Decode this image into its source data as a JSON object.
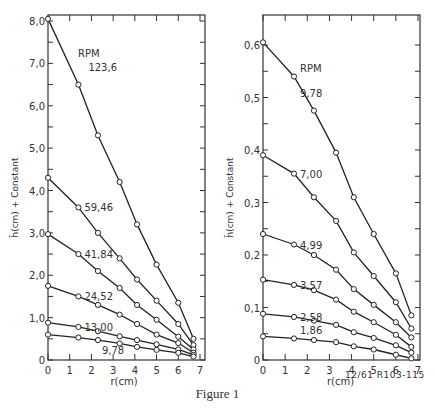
{
  "figure": {
    "caption": "Figure 1",
    "code": "12/61 R103-115"
  },
  "chart_data": [
    {
      "type": "line",
      "title": "",
      "legend_title": "RPM",
      "xlabel": "r(cm)",
      "ylabel": "h̄(cm) + Constant",
      "xlim": [
        0,
        7
      ],
      "ylim": [
        0,
        8.0
      ],
      "xticks": [
        "0",
        "1",
        "2",
        "3",
        "4",
        "5",
        "6",
        "7"
      ],
      "yticks": [
        "0",
        "1.0",
        "2.0",
        "3.0",
        "4.0",
        "5.0",
        "6.0",
        "7.0",
        "8.0"
      ],
      "x": [
        0,
        1.4,
        2.3,
        3.3,
        4.1,
        5.0,
        6.0,
        6.7
      ],
      "series": [
        {
          "name": "123.6",
          "values": [
            8.05,
            6.5,
            5.3,
            4.2,
            3.2,
            2.25,
            1.35,
            0.5
          ]
        },
        {
          "name": "59.46",
          "values": [
            4.3,
            3.6,
            3.0,
            2.4,
            1.9,
            1.4,
            0.85,
            0.35
          ]
        },
        {
          "name": "41.84",
          "values": [
            2.97,
            2.5,
            2.1,
            1.7,
            1.3,
            0.95,
            0.55,
            0.25
          ]
        },
        {
          "name": "24.52",
          "values": [
            1.75,
            1.5,
            1.3,
            1.07,
            0.85,
            0.6,
            0.4,
            0.17
          ]
        },
        {
          "name": "13.00",
          "values": [
            0.88,
            0.78,
            0.68,
            0.56,
            0.47,
            0.37,
            0.25,
            0.12
          ]
        },
        {
          "name": "9.78",
          "values": [
            0.6,
            0.53,
            0.47,
            0.39,
            0.31,
            0.24,
            0.17,
            0.08
          ]
        }
      ]
    },
    {
      "type": "line",
      "title": "",
      "legend_title": "RPM",
      "xlabel": "r(cm)",
      "ylabel": "h̄(cm) + Constant",
      "xlim": [
        0,
        7
      ],
      "ylim": [
        0,
        0.6
      ],
      "xticks": [
        "0",
        "1",
        "2",
        "3",
        "4",
        "5",
        "6",
        "7"
      ],
      "yticks": [
        "0",
        "0.1",
        "0.2",
        "0.3",
        "0.4",
        "0.5",
        "0.6"
      ],
      "x": [
        0,
        1.4,
        2.3,
        3.3,
        4.1,
        5.0,
        6.0,
        6.7
      ],
      "series": [
        {
          "name": "9.78",
          "values": [
            0.605,
            0.54,
            0.475,
            0.395,
            0.31,
            0.24,
            0.165,
            0.085
          ]
        },
        {
          "name": "7.00",
          "values": [
            0.39,
            0.355,
            0.31,
            0.265,
            0.205,
            0.16,
            0.11,
            0.06
          ]
        },
        {
          "name": "4.99",
          "values": [
            0.24,
            0.22,
            0.2,
            0.172,
            0.135,
            0.105,
            0.072,
            0.043
          ]
        },
        {
          "name": "3.57",
          "values": [
            0.153,
            0.143,
            0.133,
            0.115,
            0.092,
            0.072,
            0.048,
            0.025
          ]
        },
        {
          "name": "2.58",
          "values": [
            0.088,
            0.082,
            0.075,
            0.067,
            0.053,
            0.042,
            0.028,
            0.014
          ]
        },
        {
          "name": "1.86",
          "values": [
            0.045,
            0.041,
            0.038,
            0.034,
            0.026,
            0.02,
            0.01,
            0.003
          ]
        }
      ]
    }
  ],
  "display": {
    "left": {
      "ytick_labels": [
        "0",
        "1,0",
        "2,0",
        "3,0",
        "4,0",
        "5,0",
        "6,0",
        "7,0",
        "8,0"
      ],
      "series_labels": [
        "123,6",
        "59,46",
        "41,84",
        "24,52",
        "13,00",
        "9,78"
      ]
    },
    "right": {
      "ytick_labels": [
        "0",
        "0,1",
        "0,2",
        "0,3",
        "0,4",
        "0,5",
        "0,6"
      ],
      "series_labels": [
        "9,78",
        "7,00",
        "4,99",
        "3,57",
        "2,58",
        "1,86"
      ]
    }
  }
}
